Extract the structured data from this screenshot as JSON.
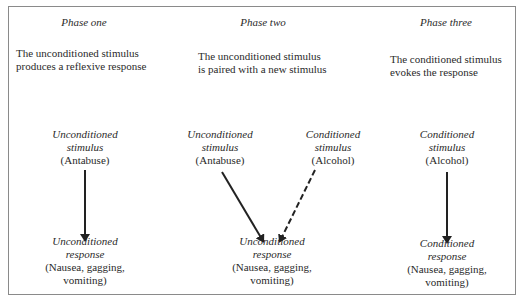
{
  "phases": [
    {
      "title": "Phase one",
      "description": [
        "The unconditioned stimulus",
        "produces a reflexive response"
      ],
      "stimulus": {
        "line1": "Unconditioned",
        "line2": "stimulus",
        "line3": "(Antabuse)"
      },
      "response": {
        "line1": "Unconditioned",
        "line2": "response",
        "line3": "(Nausea, gagging,",
        "line4": "vomiting)"
      }
    },
    {
      "title": "Phase two",
      "description": [
        "The unconditioned stimulus",
        "is paired with a new stimulus"
      ],
      "stimulus_a": {
        "line1": "Unconditioned",
        "line2": "stimulus",
        "line3": "(Antabuse)"
      },
      "stimulus_b": {
        "line1": "Conditioned",
        "line2": "stimulus",
        "line3": "(Alcohol)"
      },
      "response": {
        "line1": "Unconditioned",
        "line2": "response",
        "line3": "(Nausea, gagging,",
        "line4": "vomiting)"
      }
    },
    {
      "title": "Phase three",
      "description": [
        "The conditioned stimulus",
        "evokes the response"
      ],
      "stimulus": {
        "line1": "Conditioned",
        "line2": "stimulus",
        "line3": "(Alcohol)"
      },
      "response": {
        "line1": "Conditioned",
        "line2": "response",
        "line3": "(Nausea, gagging,",
        "line4": "vomiting)"
      }
    }
  ],
  "arrows": [
    {
      "from": "phase-one-stimulus",
      "to": "phase-one-response",
      "style": "solid"
    },
    {
      "from": "phase-two-unconditioned-stimulus",
      "to": "phase-two-response",
      "style": "solid"
    },
    {
      "from": "phase-two-conditioned-stimulus",
      "to": "phase-two-response",
      "style": "dashed"
    },
    {
      "from": "phase-three-stimulus",
      "to": "phase-three-response",
      "style": "solid"
    }
  ]
}
